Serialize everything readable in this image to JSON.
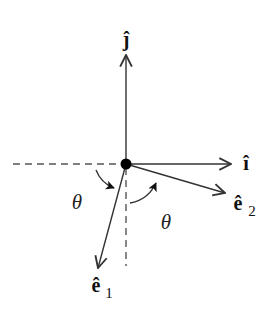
{
  "diagram": {
    "colors": {
      "line": "#333333",
      "dash": "#555555",
      "dot": "#000000",
      "background": "#ffffff"
    },
    "vectors": [
      {
        "id": "j-hat",
        "symbol": "j",
        "subscript": "",
        "direction": "up"
      },
      {
        "id": "i-hat",
        "symbol": "ı",
        "subscript": "",
        "direction": "right"
      },
      {
        "id": "e2-hat",
        "symbol": "e",
        "subscript": "2",
        "direction": "right-down, rotated by theta from i"
      },
      {
        "id": "e1-hat",
        "symbol": "e",
        "subscript": "1",
        "direction": "down-left, rotated by theta from -j"
      }
    ],
    "labels": {
      "j_hat": "ĵ",
      "i_hat": "î",
      "e1_base": "ê",
      "e1_sub": "1",
      "e2_base": "ê",
      "e2_sub": "2",
      "theta_left": "θ",
      "theta_right": "θ"
    },
    "reference_lines": [
      {
        "id": "negative-x-axis",
        "style": "dashed"
      },
      {
        "id": "negative-y-axis",
        "style": "dashed"
      }
    ],
    "angles": [
      {
        "id": "angle-left",
        "label": "θ",
        "between": [
          "negative-x-axis",
          "e1-hat"
        ]
      },
      {
        "id": "angle-right",
        "label": "θ",
        "between": [
          "negative-y-axis",
          "e2-hat"
        ]
      }
    ]
  }
}
